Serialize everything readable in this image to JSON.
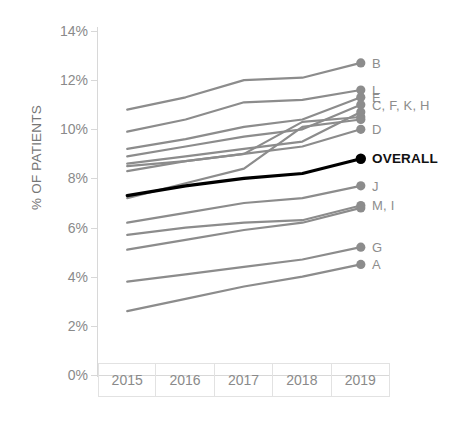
{
  "chart_data": {
    "type": "line",
    "title": "",
    "xlabel": "",
    "ylabel": "% OF PATIENTS",
    "categories": [
      "2015",
      "2016",
      "2017",
      "2018",
      "2019"
    ],
    "x": [
      2015,
      2016,
      2017,
      2018,
      2019
    ],
    "ylim": [
      0,
      14
    ],
    "ytick_labels": [
      "0%",
      "2%",
      "4%",
      "6%",
      "8%",
      "10%",
      "12%",
      "14%"
    ],
    "ytick_values": [
      0,
      2,
      4,
      6,
      8,
      10,
      12,
      14
    ],
    "grid": false,
    "legend_position": "right-endpoint-labels",
    "value_unit": "%",
    "series": [
      {
        "name": "B",
        "label": "B",
        "values": [
          10.8,
          11.3,
          12.0,
          12.1,
          12.7
        ],
        "color": "#8c8c8c",
        "emphasis": false
      },
      {
        "name": "L",
        "label": "L",
        "values": [
          9.9,
          10.4,
          11.1,
          11.2,
          11.6
        ],
        "color": "#8c8c8c",
        "emphasis": false
      },
      {
        "name": "E",
        "label": "E",
        "values": [
          9.2,
          9.6,
          10.1,
          10.4,
          11.3
        ],
        "color": "#8c8c8c",
        "emphasis": false
      },
      {
        "name": "C",
        "label": "C, F, K, H",
        "values": [
          8.9,
          9.3,
          9.7,
          10.0,
          11.0
        ],
        "color": "#8c8c8c",
        "emphasis": false
      },
      {
        "name": "F",
        "label": "",
        "values": [
          8.6,
          8.9,
          9.2,
          9.5,
          10.7
        ],
        "color": "#8c8c8c",
        "emphasis": false
      },
      {
        "name": "K",
        "label": "",
        "values": [
          8.5,
          8.7,
          9.0,
          10.3,
          10.5
        ],
        "color": "#8c8c8c",
        "emphasis": false
      },
      {
        "name": "H",
        "label": "",
        "values": [
          7.2,
          7.8,
          8.4,
          10.1,
          10.4
        ],
        "color": "#8c8c8c",
        "emphasis": false
      },
      {
        "name": "D",
        "label": "D",
        "values": [
          8.3,
          8.7,
          9.0,
          9.3,
          10.0
        ],
        "color": "#8c8c8c",
        "emphasis": false
      },
      {
        "name": "OVERALL",
        "label": "OVERALL",
        "values": [
          7.3,
          7.7,
          8.0,
          8.2,
          8.8
        ],
        "color": "#000000",
        "emphasis": true
      },
      {
        "name": "J",
        "label": "J",
        "values": [
          6.2,
          6.6,
          7.0,
          7.2,
          7.7
        ],
        "color": "#8c8c8c",
        "emphasis": false
      },
      {
        "name": "M",
        "label": "M, I",
        "values": [
          5.7,
          6.0,
          6.2,
          6.3,
          6.9
        ],
        "color": "#8c8c8c",
        "emphasis": false
      },
      {
        "name": "I",
        "label": "",
        "values": [
          5.1,
          5.5,
          5.9,
          6.2,
          6.8
        ],
        "color": "#8c8c8c",
        "emphasis": false
      },
      {
        "name": "G",
        "label": "G",
        "values": [
          3.8,
          4.1,
          4.4,
          4.7,
          5.2
        ],
        "color": "#8c8c8c",
        "emphasis": false
      },
      {
        "name": "A",
        "label": "A",
        "values": [
          2.6,
          3.1,
          3.6,
          4.0,
          4.5
        ],
        "color": "#8c8c8c",
        "emphasis": false
      }
    ]
  },
  "axis": {
    "y_title": "% OF PATIENTS"
  },
  "colors": {
    "series_default": "#8c8c8c",
    "series_emphasis": "#000000",
    "axis": "#d8d8d8",
    "tick_text": "#8a8a8a"
  }
}
